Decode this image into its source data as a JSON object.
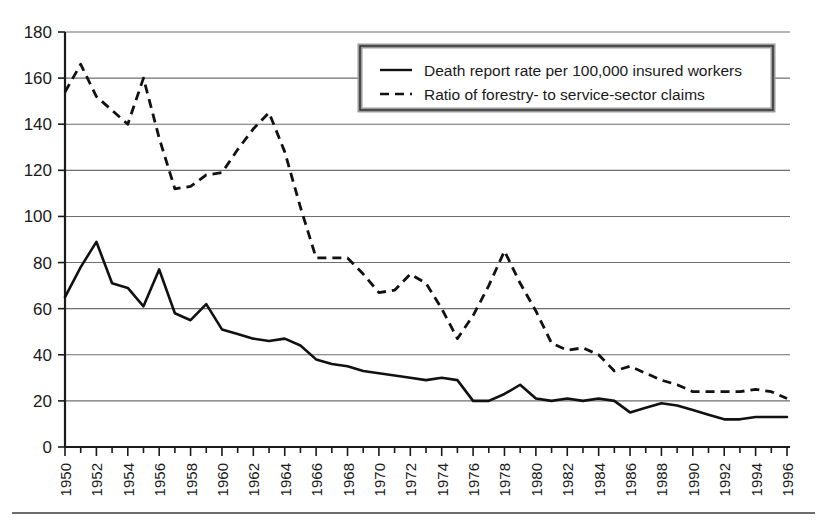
{
  "chart_data": {
    "type": "line",
    "title": "",
    "xlabel": "",
    "ylabel": "",
    "xlim": [
      1950,
      1996
    ],
    "ylim": [
      0,
      180
    ],
    "grid": true,
    "legend_position": "top-right",
    "ytick_labels": [
      "0",
      "20",
      "40",
      "60",
      "80",
      "100",
      "120",
      "140",
      "160",
      "180"
    ],
    "ytick_values": [
      0,
      20,
      40,
      60,
      80,
      100,
      120,
      140,
      160,
      180
    ],
    "xtick_labels": [
      "1950",
      "1952",
      "1954",
      "1956",
      "1958",
      "1960",
      "1962",
      "1964",
      "1966",
      "1968",
      "1970",
      "1972",
      "1974",
      "1976",
      "1978",
      "1980",
      "1982",
      "1984",
      "1986",
      "1988",
      "1990",
      "1992",
      "1994",
      "1996"
    ],
    "xtick_values": [
      1950,
      1952,
      1954,
      1956,
      1958,
      1960,
      1962,
      1964,
      1966,
      1968,
      1970,
      1972,
      1974,
      1976,
      1978,
      1980,
      1982,
      1984,
      1986,
      1988,
      1990,
      1992,
      1994,
      1996
    ],
    "x": [
      1950,
      1951,
      1952,
      1953,
      1954,
      1955,
      1956,
      1957,
      1958,
      1959,
      1960,
      1961,
      1962,
      1963,
      1964,
      1965,
      1966,
      1967,
      1968,
      1969,
      1970,
      1971,
      1972,
      1973,
      1974,
      1975,
      1976,
      1977,
      1978,
      1979,
      1980,
      1981,
      1982,
      1983,
      1984,
      1985,
      1986,
      1987,
      1988,
      1989,
      1990,
      1991,
      1992,
      1993,
      1994,
      1995,
      1996
    ],
    "series": [
      {
        "name": "Death report rate per 100,000 insured workers",
        "style": "solid",
        "values": [
          65,
          78,
          89,
          71,
          69,
          61,
          77,
          58,
          55,
          62,
          51,
          49,
          47,
          46,
          47,
          44,
          38,
          36,
          35,
          33,
          32,
          31,
          30,
          29,
          30,
          29,
          20,
          20,
          23,
          27,
          21,
          20,
          21,
          20,
          21,
          20,
          15,
          17,
          19,
          18,
          16,
          14,
          12,
          12,
          13,
          13,
          13
        ]
      },
      {
        "name": "Ratio of forestry- to service-sector claims",
        "style": "dashed",
        "values": [
          154,
          166,
          152,
          146,
          140,
          160,
          134,
          112,
          113,
          118,
          119,
          129,
          138,
          145,
          128,
          104,
          82,
          82,
          82,
          75,
          67,
          68,
          75,
          71,
          60,
          47,
          57,
          70,
          85,
          71,
          59,
          45,
          42,
          43,
          40,
          33,
          35,
          32,
          29,
          27,
          24,
          24,
          24,
          24,
          25,
          24,
          21
        ]
      }
    ]
  },
  "legend": {
    "entries": [
      {
        "label": "Death report rate per 100,000 insured workers",
        "style": "solid"
      },
      {
        "label": "Ratio of forestry- to service-sector claims",
        "style": "dashed"
      }
    ]
  }
}
